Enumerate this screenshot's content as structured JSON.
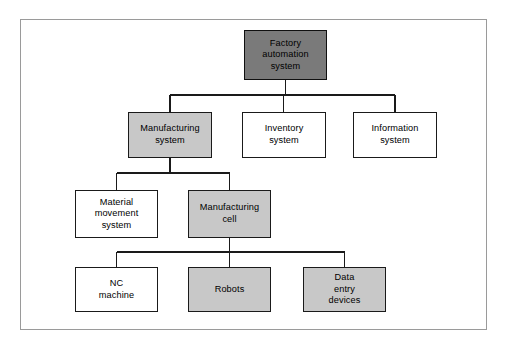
{
  "figure": {
    "kind": "hierarchy-tree-diagram",
    "frame": {
      "visible": true,
      "border_color": "#9a9a9a"
    },
    "palette": {
      "dark_gray": "#7a7a7a",
      "light_gray": "#c8c8c8",
      "white": "#ffffff",
      "line": "#1a1a1a",
      "text": "#000000"
    }
  },
  "nodes": {
    "root": {
      "label": "Factory\nautomation\nsystem",
      "fill": "dark-gray",
      "level": 1
    },
    "manufacturing_system": {
      "label": "Manufacturing\nsystem",
      "fill": "light-gray",
      "level": 2
    },
    "inventory_system": {
      "label": "Inventory\nsystem",
      "fill": "white",
      "level": 2
    },
    "information_system": {
      "label": "Information\nsystem",
      "fill": "white",
      "level": 2
    },
    "material_movement_system": {
      "label": "Material\nmovement\nsystem",
      "fill": "white",
      "level": 3
    },
    "manufacturing_cell": {
      "label": "Manufacturing\ncell",
      "fill": "light-gray",
      "level": 3
    },
    "nc_machine": {
      "label": "NC\nmachine",
      "fill": "white",
      "level": 4
    },
    "robots": {
      "label": "Robots",
      "fill": "light-gray",
      "level": 4
    },
    "data_entry_devices": {
      "label": "Data\nentry\ndevices",
      "fill": "light-gray",
      "level": 4
    }
  },
  "edges": [
    {
      "from": "root",
      "to": "manufacturing_system"
    },
    {
      "from": "root",
      "to": "inventory_system"
    },
    {
      "from": "root",
      "to": "information_system"
    },
    {
      "from": "manufacturing_system",
      "to": "material_movement_system"
    },
    {
      "from": "manufacturing_system",
      "to": "manufacturing_cell"
    },
    {
      "from": "manufacturing_cell",
      "to": "nc_machine"
    },
    {
      "from": "manufacturing_cell",
      "to": "robots"
    },
    {
      "from": "manufacturing_cell",
      "to": "data_entry_devices"
    }
  ]
}
